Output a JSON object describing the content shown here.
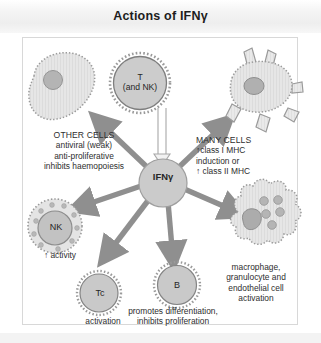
{
  "figure": {
    "title": "Actions of IFNγ",
    "panel_border_color": "#d8d8d8",
    "background_color": "#ffffff"
  },
  "palette": {
    "cell_fill": "#e2e2e2",
    "cell_stroke": "#8c8c8c",
    "nucleus_fill": "#b0b0b0",
    "hub_fill": "#cfcfcf",
    "arrow_fill": "#8f8f8f",
    "text": "#2e2e2e"
  },
  "center": {
    "name": "IFN-gamma",
    "label": "IFNγ"
  },
  "source_cell": {
    "name": "t-and-nk-cell",
    "label_line1": "T",
    "label_line2": "(and NK)"
  },
  "targets": [
    {
      "id": "other-cells",
      "cell_label": "",
      "caption_lines": [
        "OTHER CELLS",
        "antiviral (weak)",
        "anti-proliferative",
        "inhibits haemopoiesis"
      ]
    },
    {
      "id": "many-cells",
      "cell_label": "",
      "caption_lines": [
        "MANY CELLS",
        "↑class I MHC",
        "induction or",
        "↑ class II MHC"
      ]
    },
    {
      "id": "nk-cell",
      "cell_label": "NK",
      "caption_lines": [
        "↑ activity"
      ]
    },
    {
      "id": "tc-cell",
      "cell_label": "Tc",
      "caption_lines": [
        "activation"
      ]
    },
    {
      "id": "b-cell",
      "cell_label": "B",
      "caption_lines": [
        "promotes differentiation,",
        "inhibits proliferation"
      ]
    },
    {
      "id": "macrophage",
      "cell_label": "",
      "caption_lines": [
        "macrophage,",
        "granulocyte and",
        "endothelial cell",
        "activation"
      ]
    }
  ]
}
